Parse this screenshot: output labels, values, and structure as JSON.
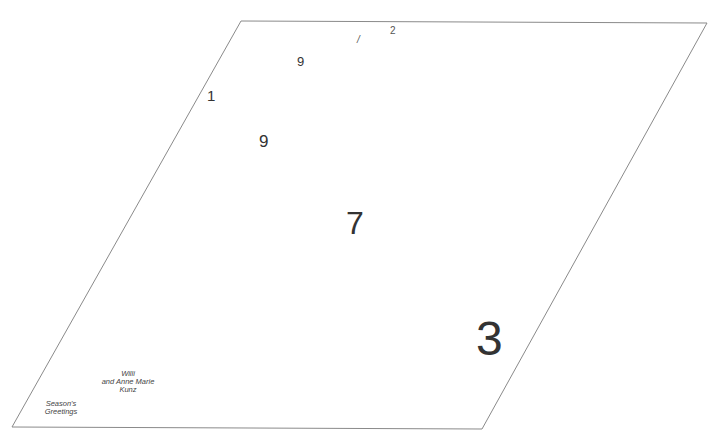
{
  "card": {
    "shape": "parallelogram",
    "outline_color": "#8a8a8a",
    "background": "#ffffff",
    "vertices": {
      "top_left": [
        241,
        21
      ],
      "top_right": [
        707,
        23
      ],
      "bottom_right": [
        482,
        429
      ],
      "bottom_left": [
        12,
        427
      ]
    }
  },
  "numerals": {
    "one": "1",
    "nine_small": "9",
    "slash_mark": "/",
    "two": "2",
    "nine_medium": "9",
    "seven": "7",
    "three": "3"
  },
  "captions": {
    "names": {
      "line1": "Willi",
      "line2": "and Anne Marie",
      "line3": "Kunz"
    },
    "greeting": {
      "line1": "Season's",
      "line2": "Greetings"
    }
  }
}
